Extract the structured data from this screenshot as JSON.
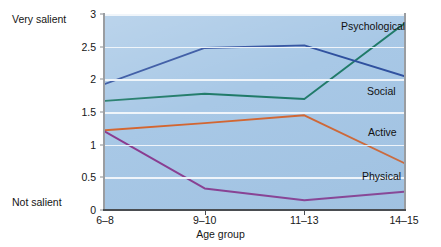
{
  "chart_data": {
    "type": "line",
    "title": "",
    "xlabel": "Age group",
    "ylabel": "",
    "categories": [
      "6–8",
      "9–10",
      "11–13",
      "14–15"
    ],
    "ylim": [
      0,
      3
    ],
    "yticks": [
      "0",
      "0.5",
      "1",
      "1.5",
      "2",
      "2.5",
      "3"
    ],
    "ytick_values": [
      0,
      0.5,
      1,
      1.5,
      2,
      2.5,
      3
    ],
    "grid": true,
    "legend_position": "inline-right",
    "axis_top_annotation": "Very salient",
    "axis_bottom_annotation": "Not salient",
    "plot_background": "#a8c8e6",
    "series": [
      {
        "name": "Psychological",
        "color": "#1f7a68",
        "values": [
          1.67,
          1.78,
          1.7,
          2.85
        ]
      },
      {
        "name": "Social",
        "color": "#2e4f9e",
        "values": [
          1.93,
          2.48,
          2.52,
          2.05
        ]
      },
      {
        "name": "Active",
        "color": "#d4652f",
        "values": [
          1.22,
          1.33,
          1.45,
          0.72
        ]
      },
      {
        "name": "Physical",
        "color": "#8a3a8f",
        "values": [
          1.2,
          0.33,
          0.15,
          0.28
        ]
      }
    ]
  }
}
